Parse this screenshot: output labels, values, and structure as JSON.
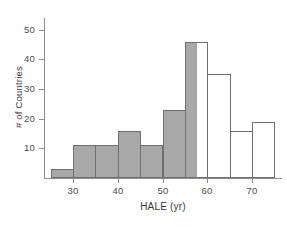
{
  "chart_data": {
    "type": "bar",
    "title": "",
    "xlabel": "HALE (yr)",
    "ylabel": "# of Countries",
    "bin_width": 5,
    "bin_edges": [
      25,
      30,
      35,
      40,
      45,
      50,
      55,
      60,
      65,
      70,
      75
    ],
    "categories": [
      "25-30",
      "30-35",
      "35-40",
      "40-45",
      "45-50",
      "50-55",
      "55-60",
      "60-65",
      "65-70",
      "70-75"
    ],
    "bin_centers": [
      27.5,
      32.5,
      37.5,
      42.5,
      47.5,
      52.5,
      57.5,
      62.5,
      67.5,
      72.5
    ],
    "values": [
      3,
      11,
      11,
      16,
      11,
      23,
      46,
      35,
      16,
      19
    ],
    "bar_styles": [
      "filled",
      "filled",
      "filled",
      "filled",
      "filled",
      "filled",
      "split",
      "open",
      "open",
      "open"
    ],
    "shading_note": "Bars up to 57.5 yr are gray-filled; bars above are unfilled (white outline).",
    "xlim": [
      23.5,
      76.5
    ],
    "ylim": [
      0,
      54
    ],
    "xticks": [
      30,
      40,
      50,
      60,
      70
    ],
    "xtick_labels": [
      "30",
      "40",
      "50",
      "60",
      "70"
    ],
    "yticks": [
      10,
      20,
      30,
      40,
      50
    ],
    "ytick_labels": [
      "10",
      "20",
      "30",
      "40",
      "50"
    ],
    "grid": false,
    "legend": null,
    "colors": {
      "filled_bar": "#a8a8a8",
      "bar_outline": "#6f6f6f",
      "open_bar": "#ffffff",
      "axis": "#8d8d8d",
      "text": "#3a3a3a",
      "background": "#ffffff"
    }
  }
}
